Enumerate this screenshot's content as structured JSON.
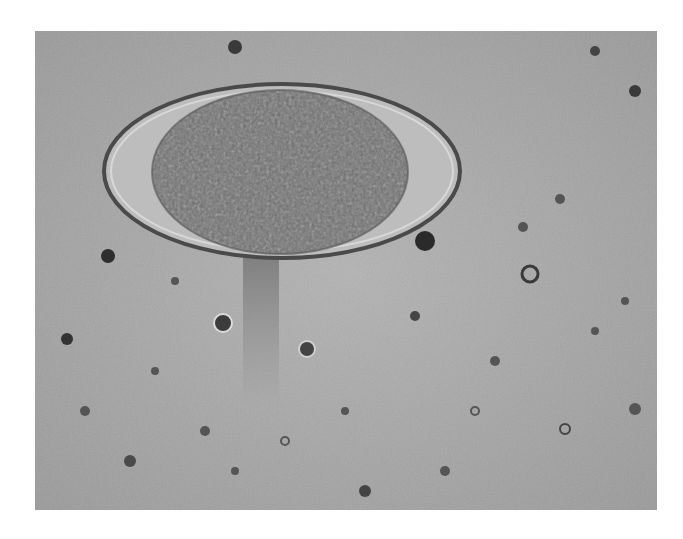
{
  "image": {
    "kind": "micrograph",
    "subject": "parasite egg (oval shell with granular embryo) in background of debris",
    "palette": {
      "background": "#a9a9a9",
      "background_dark": "#8f8f8f",
      "shell_edge": "#4a4a4a",
      "shell_inner": "#bdbdbd",
      "embryo": "#6e6e6e",
      "embryo_light": "#8a8a8a",
      "debris_dark": "#2e2e2e",
      "page": "#ffffff"
    }
  }
}
